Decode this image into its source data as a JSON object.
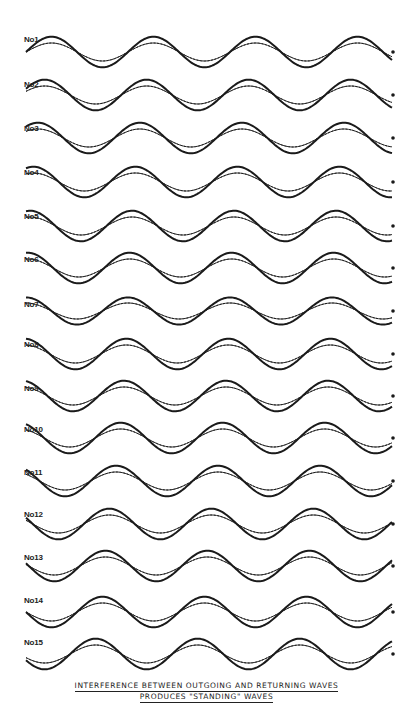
{
  "diagram": {
    "title_line_1": "INTERFERENCE BETWEEN OUTGOING AND RETURNING WAVES",
    "title_line_2": "PRODUCES \"STANDING\" WAVES",
    "x_start": 26,
    "x_end": 393,
    "period_px": 102,
    "legend": {
      "thin_solid": "outgoing wave",
      "dashed": "returning wave",
      "thick": "resultant wave"
    },
    "colors": {
      "ink": "#1a1a1a",
      "paper": "#ffffff"
    }
  },
  "rows": [
    {
      "label": "No1",
      "center_y": 52,
      "label_y": 35,
      "amp": 9,
      "outgoing_phase": 0,
      "returning_phase": 180
    },
    {
      "label": "No2",
      "center_y": 95,
      "label_y": 80,
      "amp": 9,
      "outgoing_phase": 24,
      "returning_phase": 156
    },
    {
      "label": "No3",
      "center_y": 138,
      "label_y": 124,
      "amp": 9,
      "outgoing_phase": 48,
      "returning_phase": 132
    },
    {
      "label": "No4",
      "center_y": 182,
      "label_y": 168,
      "amp": 9,
      "outgoing_phase": 64,
      "returning_phase": 116
    },
    {
      "label": "No5",
      "center_y": 226,
      "label_y": 212,
      "amp": 9,
      "outgoing_phase": 76,
      "returning_phase": 104
    },
    {
      "label": "No6",
      "center_y": 268,
      "label_y": 255,
      "amp": 9,
      "outgoing_phase": 84,
      "returning_phase": 96
    },
    {
      "label": "No7",
      "center_y": 311,
      "label_y": 300,
      "amp": 8,
      "outgoing_phase": 90,
      "returning_phase": 90
    },
    {
      "label": "No8",
      "center_y": 354,
      "label_y": 340,
      "amp": 9,
      "outgoing_phase": 96,
      "returning_phase": 84
    },
    {
      "label": "No9",
      "center_y": 396,
      "label_y": 384,
      "amp": 9,
      "outgoing_phase": 104,
      "returning_phase": 76
    },
    {
      "label": "No10",
      "center_y": 438,
      "label_y": 425,
      "amp": 9,
      "outgoing_phase": 116,
      "returning_phase": 64
    },
    {
      "label": "No11",
      "center_y": 481,
      "label_y": 468,
      "amp": 9,
      "outgoing_phase": 132,
      "returning_phase": 48
    },
    {
      "label": "No12",
      "center_y": 524,
      "label_y": 510,
      "amp": 9,
      "outgoing_phase": 156,
      "returning_phase": 24
    },
    {
      "label": "No13",
      "center_y": 566,
      "label_y": 553,
      "amp": 9,
      "outgoing_phase": 170,
      "returning_phase": 10
    },
    {
      "label": "No14",
      "center_y": 612,
      "label_y": 596,
      "amp": 9,
      "outgoing_phase": 180,
      "returning_phase": 0
    },
    {
      "label": "No15",
      "center_y": 654,
      "label_y": 638,
      "amp": 9,
      "outgoing_phase": 204,
      "returning_phase": -24
    }
  ]
}
